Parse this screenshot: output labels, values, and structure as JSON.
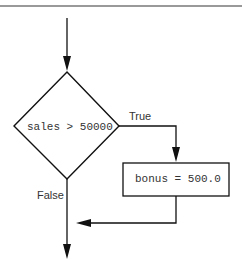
{
  "diagram": {
    "type": "flowchart",
    "decision": {
      "condition": "sales > 50000",
      "true_label": "True",
      "false_label": "False"
    },
    "process": {
      "statement": "bonus = 500.0"
    },
    "colors": {
      "stroke": "#111111",
      "text": "#333333",
      "rule": "#777777",
      "background": "#ffffff"
    }
  }
}
